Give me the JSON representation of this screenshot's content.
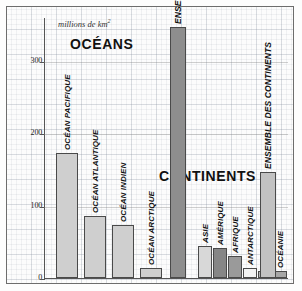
{
  "figure": {
    "unit_label": "millions de km",
    "unit_exponent": "2",
    "section_oceans": "OCÉANS",
    "section_continents": "CONTINENTS"
  },
  "axis": {
    "ticks": [
      "300",
      "200",
      "100",
      "0"
    ],
    "tick_values": [
      300,
      200,
      100,
      0
    ],
    "ymin": 0,
    "ymax": 360
  },
  "chart_data": {
    "type": "bar",
    "title": "",
    "xlabel": "",
    "ylabel": "millions de km2",
    "ylim": [
      0,
      360
    ],
    "grid": true,
    "legend": "none",
    "categories": [
      "OCÉAN PACIFIQUE",
      "OCÉAN ATLANTIQUE",
      "OCÉAN INDIEN",
      "OCÉAN ARCTIQUE",
      "ENSEMBLE DES OCÉANS",
      "ASIE",
      "AMÉRIQUE",
      "AFRIQUE",
      "ANTARCTIQUE",
      "EUROPE",
      "OCÉANIE",
      "ENSEMBLE DES CONTINENTS"
    ],
    "values": [
      173,
      86,
      73,
      14,
      346,
      44,
      42,
      30,
      14,
      10,
      9,
      146
    ],
    "groups": [
      "OCÉANS",
      "CONTINENTS"
    ]
  },
  "bars": [
    {
      "label": "OCÉAN PACIFIQUE",
      "value": 173,
      "x": 12,
      "w": 22,
      "color": "#cfcfcf",
      "group": "oceans",
      "label_size": "normal"
    },
    {
      "label": "OCÉAN ATLANTIQUE",
      "value": 86,
      "x": 40,
      "w": 22,
      "color": "#cfcfcf",
      "group": "oceans",
      "label_size": "normal"
    },
    {
      "label": "OCÉAN INDIEN",
      "value": 73,
      "x": 68,
      "w": 22,
      "color": "#cfcfcf",
      "group": "oceans",
      "label_size": "normal"
    },
    {
      "label": "OCÉAN ARCTIQUE",
      "value": 14,
      "x": 96,
      "w": 22,
      "color": "#cfcfcf",
      "group": "oceans",
      "label_size": "normal"
    },
    {
      "label": "ENSEMBLE DES OCÉANS",
      "value": 346,
      "x": 126,
      "w": 16,
      "color": "#8e8e8e",
      "group": "oceans",
      "label_size": "big"
    },
    {
      "label": "ASIE",
      "value": 44,
      "x": 154,
      "w": 14,
      "color": "#d8d8d8",
      "group": "continents",
      "label_size": "normal"
    },
    {
      "label": "AMÉRIQUE",
      "value": 42,
      "x": 169,
      "w": 14,
      "color": "#868686",
      "group": "continents",
      "label_size": "normal"
    },
    {
      "label": "AFRIQUE",
      "value": 30,
      "x": 184,
      "w": 14,
      "color": "#9a9a9a",
      "group": "continents",
      "label_size": "normal"
    },
    {
      "label": "ANTARCTIQUE",
      "value": 14,
      "x": 199,
      "w": 14,
      "color": "#f2f2f2",
      "group": "continents",
      "label_size": "normal"
    },
    {
      "label": "EUROPE",
      "value": 10,
      "x": 214,
      "w": 14,
      "color": "#b4b4b4",
      "group": "continents",
      "label_size": "normal"
    },
    {
      "label": "OCÉANIE",
      "value": 9,
      "x": 229,
      "w": 14,
      "color": "#a6a6a6",
      "group": "continents",
      "label_size": "normal"
    },
    {
      "label": "ENSEMBLE DES CONTINENTS",
      "value": 146,
      "x": 216,
      "w": 16,
      "color": "#c2c2c2",
      "group": "continents",
      "label_size": "big"
    }
  ]
}
